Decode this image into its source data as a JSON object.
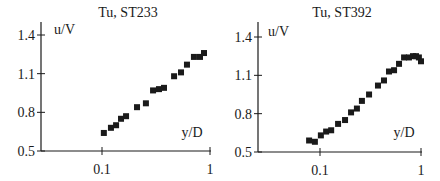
{
  "chart_data": [
    {
      "type": "scatter",
      "title": "Tu, ST233",
      "xlabel": "y/D",
      "ylabel": "u/V",
      "xscale": "log",
      "xlim": [
        0.03,
        1
      ],
      "ylim": [
        0.5,
        1.5
      ],
      "xticks": [
        0.1,
        1
      ],
      "xtick_labels": [
        "0.1",
        "1"
      ],
      "yticks": [
        0.5,
        0.8,
        1.1,
        1.4
      ],
      "ytick_labels": [
        "0.5",
        "0.8",
        "1.1",
        "1.4"
      ],
      "grid": false,
      "legend": null,
      "marker": "square",
      "series": [
        {
          "name": "ST233",
          "x": [
            0.104,
            0.121,
            0.135,
            0.15,
            0.167,
            0.211,
            0.255,
            0.297,
            0.337,
            0.375,
            0.465,
            0.539,
            0.612,
            0.71,
            0.808,
            0.88
          ],
          "y": [
            0.64,
            0.68,
            0.7,
            0.75,
            0.77,
            0.84,
            0.87,
            0.97,
            0.98,
            0.99,
            1.08,
            1.11,
            1.17,
            1.23,
            1.23,
            1.26
          ]
        }
      ]
    },
    {
      "type": "scatter",
      "title": "Tu, ST392",
      "xlabel": "y/D",
      "ylabel": "u/V",
      "xscale": "log",
      "xlim": [
        0.03,
        1
      ],
      "ylim": [
        0.5,
        1.5
      ],
      "xticks": [
        0.1,
        1
      ],
      "xtick_labels": [
        "0.1",
        "1"
      ],
      "yticks": [
        0.5,
        0.8,
        1.1,
        1.4
      ],
      "ytick_labels": [
        "0.5",
        "0.8",
        "1.1",
        "1.4"
      ],
      "grid": false,
      "legend": null,
      "marker": "square",
      "series": [
        {
          "name": "ST392",
          "x": [
            0.078,
            0.089,
            0.102,
            0.115,
            0.129,
            0.151,
            0.177,
            0.203,
            0.232,
            0.26,
            0.306,
            0.375,
            0.43,
            0.482,
            0.541,
            0.606,
            0.68,
            0.76,
            0.833,
            0.892,
            0.953,
            1.0
          ],
          "y": [
            0.59,
            0.58,
            0.63,
            0.66,
            0.67,
            0.72,
            0.75,
            0.81,
            0.84,
            0.9,
            0.95,
            1.02,
            1.06,
            1.13,
            1.14,
            1.19,
            1.24,
            1.24,
            1.25,
            1.25,
            1.24,
            1.21
          ]
        }
      ]
    }
  ],
  "layout": {
    "panels": [
      {
        "axis_x": 41,
        "x_zero": 41,
        "x_dec01": 102,
        "x_dec1": 210,
        "y_05": 151,
        "y_14": 35,
        "y_top": 22,
        "title_x": 128,
        "title_y": 17,
        "ylabel_x": 54,
        "ylabel_y": 34,
        "xlabel_x": 192,
        "xlabel_y": 137
      },
      {
        "axis_x": 258,
        "x_zero": 258,
        "x_dec01": 320,
        "x_dec1": 421,
        "y_05": 152,
        "y_14": 37,
        "y_top": 22,
        "title_x": 342,
        "title_y": 17,
        "ylabel_x": 268,
        "ylabel_y": 36,
        "xlabel_x": 404,
        "xlabel_y": 137
      }
    ],
    "colors": {
      "ink": "#1a1a1a",
      "background": "#ffffff"
    }
  }
}
